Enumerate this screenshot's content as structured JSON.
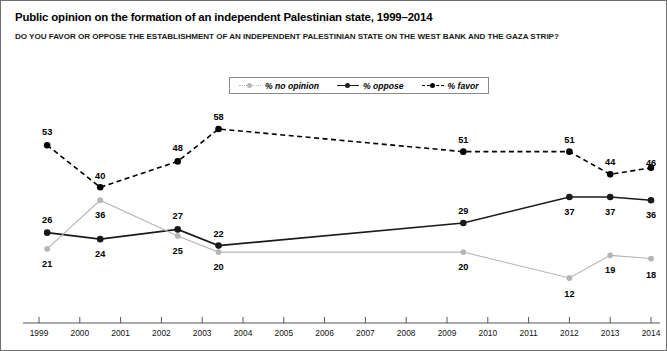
{
  "chart_data": {
    "type": "line",
    "title": "Public opinion on the formation of an independent Palestinian state, 1999–2014",
    "subtitle": "DO YOU FAVOR OR OPPOSE THE ESTABLISHMENT OF AN INDEPENDENT PALESTINIAN STATE ON THE WEST BANK AND THE GAZA STRIP?",
    "xlabel": "",
    "ylabel": "",
    "xlim": [
      1999,
      2014
    ],
    "ylim": [
      0,
      62
    ],
    "grid": false,
    "legend_position": "top-center",
    "x": [
      1999.2,
      2000.5,
      2002.4,
      2003.4,
      2009.4,
      2012.0,
      2013.0,
      2014.0
    ],
    "tick_labels": [
      "1999",
      "2000",
      "2001",
      "2002",
      "2003",
      "2004",
      "2005",
      "2006",
      "2007",
      "2008",
      "2009",
      "2010",
      "2011",
      "2012",
      "2013",
      "2014"
    ],
    "series": [
      {
        "name": "% favor",
        "color": "#000000",
        "style": "dashed",
        "values": [
          53,
          40,
          48,
          58,
          51,
          51,
          44,
          46
        ]
      },
      {
        "name": "% oppose",
        "color": "#1a1a1a",
        "style": "solid",
        "values": [
          26,
          24,
          27,
          22,
          29,
          37,
          37,
          36
        ]
      },
      {
        "name": "% no opinion",
        "color": "#b5b5b5",
        "style": "solid",
        "values": [
          21,
          36,
          25,
          20,
          20,
          12,
          19,
          18
        ]
      }
    ],
    "legend": [
      {
        "label": "% no opinion",
        "color": "#b5b5b5",
        "style": "dotted"
      },
      {
        "label": "% oppose",
        "color": "#1a1a1a",
        "style": "solid"
      },
      {
        "label": "% favor",
        "color": "#000000",
        "style": "dashed"
      }
    ]
  }
}
